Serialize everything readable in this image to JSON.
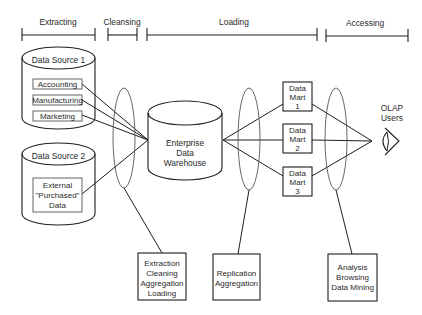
{
  "diagram": {
    "type": "data-warehouse-architecture",
    "phases": [
      {
        "label": "Extracting",
        "x1": 22,
        "x2": 95
      },
      {
        "label": "Cleansing",
        "x1": 108,
        "x2": 137
      },
      {
        "label": "Loading",
        "x1": 147,
        "x2": 317
      },
      {
        "label": "Accessing",
        "x1": 326,
        "x2": 408
      }
    ],
    "data_source_1": {
      "title": "Data Source 1",
      "items": [
        "Accounting",
        "Manufacturing",
        "Marketing"
      ]
    },
    "data_source_2": {
      "title": "Data Source 2",
      "item_lines": [
        "External",
        "\"Purchased\"",
        "Data"
      ]
    },
    "warehouse": {
      "lines": [
        "Enterprise",
        "Data",
        "Warehouse"
      ]
    },
    "data_marts": [
      {
        "lines": [
          "Data",
          "Mart",
          "1"
        ]
      },
      {
        "lines": [
          "Data",
          "Mart",
          "2"
        ]
      },
      {
        "lines": [
          "Data",
          "Mart",
          "3"
        ]
      }
    ],
    "users": {
      "lines": [
        "OLAP",
        "Users"
      ],
      "icon": "eye-icon"
    },
    "process_boxes": [
      {
        "lines": [
          "Extraction",
          "Cleaning",
          "Aggregation",
          "Loading"
        ]
      },
      {
        "lines": [
          "Replication",
          "Aggregation"
        ]
      },
      {
        "lines": [
          "Analysis",
          "Browsing",
          "Data Mining"
        ]
      }
    ],
    "colors": {
      "line": "#1e1e1e",
      "oval": "#555555",
      "text": "#2a2a2a",
      "background": "#ffffff"
    }
  }
}
